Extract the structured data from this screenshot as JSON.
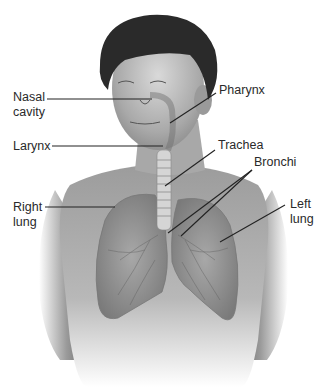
{
  "diagram": {
    "labels": {
      "nasal_cavity": "Nasal\ncavity",
      "larynx": "Larynx",
      "right_lung": "Right\nlung",
      "pharynx": "Pharynx",
      "trachea": "Trachea",
      "bronchi": "Bronchi",
      "left_lung": "Left\nlung"
    }
  }
}
